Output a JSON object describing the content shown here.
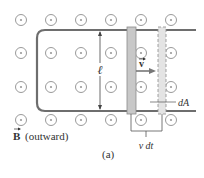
{
  "figure": {
    "panel_label": "(a)",
    "field_label_symbol": "B",
    "field_label_text": "(outward)",
    "length_label": "ℓ",
    "velocity_label": "v",
    "area_label": "dA",
    "width_label": "v dt"
  },
  "field_dots": {
    "columns_x": [
      21,
      51,
      81,
      111,
      141,
      171
    ],
    "rows_y": [
      20,
      53,
      87,
      120
    ],
    "symbol": "dot-in-circle (field out of page)"
  },
  "colors": {
    "rail": "#6e6e6e",
    "bar_fill": "#c8c8c8",
    "bar_stroke": "#8a8a8a",
    "dashed_bar_fill": "#e4e4e4",
    "dot_circle": "#9a9a9a",
    "text": "#333333"
  }
}
